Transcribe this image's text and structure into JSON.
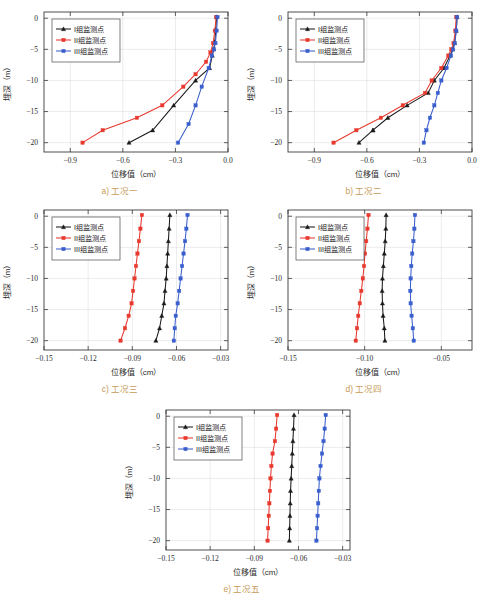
{
  "figure": {
    "axis_titles": {
      "x": "位移值（cm）",
      "y": "埋深（m）"
    },
    "legend": [
      {
        "label": "I组监测点",
        "color": "#1a1a1a",
        "marker": "triangle"
      },
      {
        "label": "II组监测点",
        "color": "#e8392f",
        "marker": "square"
      },
      {
        "label": "III组监测点",
        "color": "#3a5fcd",
        "marker": "square"
      }
    ],
    "colors": {
      "group1": "#1a1a1a",
      "group2": "#e8392f",
      "group3": "#3a5fcd",
      "caption": "#c79a57"
    }
  },
  "chart_data": [
    {
      "id": "a",
      "type": "line",
      "title": "a) 工况一",
      "xlabel": "位移值（cm）",
      "ylabel": "埋深（m）",
      "xlim": [
        -1.05,
        0.0
      ],
      "ylim": [
        -21.5,
        1.0
      ],
      "xticks": [
        -0.9,
        -0.6,
        -0.3,
        0.0
      ],
      "xticklabels": [
        "−0.9",
        "−0.6",
        "−0.3",
        "0.0"
      ],
      "yticks": [
        0,
        -5,
        -10,
        -15,
        -20
      ],
      "yticklabels": [
        "0",
        "−5",
        "−10",
        "−15",
        "−20"
      ],
      "grid": true,
      "legend_position": "upper-left",
      "series": [
        {
          "name": "I组监测点",
          "color": "#1a1a1a",
          "marker": "triangle",
          "x": [
            -0.065,
            -0.07,
            -0.075,
            -0.082,
            -0.09,
            -0.105,
            -0.185,
            -0.31,
            -0.43,
            -0.565
          ],
          "y": [
            0.2,
            -1.8,
            -3.8,
            -5.0,
            -6.0,
            -8.0,
            -10.0,
            -14.0,
            -18.0,
            -20.0
          ]
        },
        {
          "name": "II组监测点",
          "color": "#e8392f",
          "marker": "square",
          "x": [
            -0.068,
            -0.075,
            -0.085,
            -0.1,
            -0.125,
            -0.185,
            -0.255,
            -0.375,
            -0.52,
            -0.715,
            -0.83
          ],
          "y": [
            0.2,
            -2.0,
            -4.0,
            -5.5,
            -7.0,
            -9.0,
            -11.0,
            -14.0,
            -16.0,
            -18.0,
            -20.0
          ]
        },
        {
          "name": "III组监测点",
          "color": "#3a5fcd",
          "marker": "square",
          "x": [
            -0.06,
            -0.065,
            -0.072,
            -0.08,
            -0.092,
            -0.11,
            -0.15,
            -0.185,
            -0.225,
            -0.285
          ],
          "y": [
            0.2,
            -2.0,
            -4.0,
            -5.0,
            -6.0,
            -8.0,
            -11.0,
            -14.0,
            -17.0,
            -20.0
          ]
        }
      ]
    },
    {
      "id": "b",
      "type": "line",
      "title": "b) 工况二",
      "xlabel": "位移值（cm）",
      "ylabel": "埋深（m）",
      "xlim": [
        -1.05,
        0.0
      ],
      "ylim": [
        -21.5,
        1.0
      ],
      "xticks": [
        -0.9,
        -0.6,
        -0.3,
        0.0
      ],
      "xticklabels": [
        "−0.9",
        "−0.6",
        "−0.3",
        "0.0"
      ],
      "yticks": [
        0,
        -5,
        -10,
        -15,
        -20
      ],
      "yticklabels": [
        "0",
        "−5",
        "−10",
        "−15",
        "−20"
      ],
      "grid": true,
      "legend_position": "upper-left",
      "series": [
        {
          "name": "I组监测点",
          "color": "#1a1a1a",
          "marker": "triangle",
          "x": [
            -0.085,
            -0.09,
            -0.1,
            -0.11,
            -0.125,
            -0.16,
            -0.215,
            -0.25,
            -0.37,
            -0.48,
            -0.565
          ],
          "y": [
            0.2,
            -2.0,
            -4.0,
            -5.0,
            -6.0,
            -8.0,
            -10.0,
            -12.0,
            -14.0,
            -16.0,
            -18.0
          ]
        },
        {
          "name": "I组监测点-tail",
          "color": "#1a1a1a",
          "marker": "triangle",
          "x": [
            -0.565,
            -0.645
          ],
          "y": [
            -18.0,
            -20.0
          ]
        },
        {
          "name": "II组监测点",
          "color": "#e8392f",
          "marker": "square",
          "x": [
            -0.09,
            -0.095,
            -0.105,
            -0.118,
            -0.135,
            -0.175,
            -0.23,
            -0.268,
            -0.395,
            -0.52,
            -0.66,
            -0.79
          ],
          "y": [
            0.2,
            -2.0,
            -4.0,
            -5.0,
            -6.0,
            -8.0,
            -10.0,
            -12.0,
            -14.0,
            -16.0,
            -18.0,
            -20.0
          ]
        },
        {
          "name": "III组监测点",
          "color": "#3a5fcd",
          "marker": "square",
          "x": [
            -0.085,
            -0.09,
            -0.098,
            -0.108,
            -0.12,
            -0.145,
            -0.175,
            -0.195,
            -0.215,
            -0.24,
            -0.26,
            -0.275
          ],
          "y": [
            0.2,
            -2.0,
            -4.0,
            -5.0,
            -6.0,
            -8.0,
            -10.0,
            -12.0,
            -14.0,
            -16.0,
            -18.0,
            -20.0
          ]
        }
      ]
    },
    {
      "id": "c",
      "type": "line",
      "title": "c) 工况三",
      "xlabel": "位移值（cm）",
      "ylabel": "埋深（m）",
      "xlim": [
        -0.15,
        -0.025
      ],
      "ylim": [
        -21.5,
        1.0
      ],
      "xticks": [
        -0.15,
        -0.12,
        -0.09,
        -0.06,
        -0.03
      ],
      "xticklabels": [
        "−0.15",
        "−0.12",
        "−0.09",
        "−0.06",
        "−0.03"
      ],
      "yticks": [
        0,
        -5,
        -10,
        -15,
        -20
      ],
      "yticklabels": [
        "0",
        "−5",
        "−10",
        "−15",
        "−20"
      ],
      "grid": true,
      "legend_position": "upper-left",
      "series": [
        {
          "name": "I组监测点",
          "color": "#1a1a1a",
          "marker": "triangle",
          "x": [
            -0.0645,
            -0.065,
            -0.0655,
            -0.066,
            -0.0665,
            -0.067,
            -0.0678,
            -0.0685,
            -0.07,
            -0.0715,
            -0.074
          ],
          "y": [
            0.2,
            -2.0,
            -4.0,
            -6.0,
            -8.0,
            -10.0,
            -12.0,
            -14.0,
            -16.0,
            -18.0,
            -20.0
          ]
        },
        {
          "name": "II组监测点",
          "color": "#e8392f",
          "marker": "square",
          "x": [
            -0.0835,
            -0.0845,
            -0.0855,
            -0.0865,
            -0.0875,
            -0.0885,
            -0.0895,
            -0.0905,
            -0.0925,
            -0.095,
            -0.098
          ],
          "y": [
            0.2,
            -2.0,
            -4.0,
            -6.0,
            -8.0,
            -10.0,
            -12.0,
            -14.0,
            -16.0,
            -18.0,
            -20.0
          ]
        },
        {
          "name": "III组监测点",
          "color": "#3a5fcd",
          "marker": "square",
          "x": [
            -0.0525,
            -0.0533,
            -0.0542,
            -0.0552,
            -0.0562,
            -0.0572,
            -0.0582,
            -0.0592,
            -0.0605,
            -0.0612,
            -0.0618
          ],
          "y": [
            0.2,
            -2.0,
            -4.0,
            -6.0,
            -8.0,
            -10.0,
            -12.0,
            -14.0,
            -16.0,
            -18.0,
            -20.0
          ]
        }
      ]
    },
    {
      "id": "d",
      "type": "line",
      "title": "d) 工况四",
      "xlabel": "位移值（cm）",
      "ylabel": "埋深（m）",
      "xlim": [
        -0.15,
        -0.03
      ],
      "ylim": [
        -21.5,
        1.0
      ],
      "xticks": [
        -0.15,
        -0.1,
        -0.05
      ],
      "xticklabels": [
        "−0.15",
        "−0.10",
        "−0.05"
      ],
      "yticks": [
        0,
        -5,
        -10,
        -15,
        -20
      ],
      "yticklabels": [
        "0",
        "−5",
        "−10",
        "−15",
        "−20"
      ],
      "grid": true,
      "legend_position": "upper-left",
      "series": [
        {
          "name": "I组监测点",
          "color": "#1a1a1a",
          "marker": "triangle",
          "x": [
            -0.086,
            -0.0862,
            -0.0866,
            -0.0872,
            -0.0878,
            -0.0884,
            -0.0886,
            -0.0884,
            -0.088,
            -0.0872,
            -0.0868
          ],
          "y": [
            0.2,
            -2.0,
            -4.0,
            -6.0,
            -8.0,
            -10.0,
            -12.0,
            -14.0,
            -16.0,
            -18.0,
            -20.0
          ]
        },
        {
          "name": "II组监测点",
          "color": "#e8392f",
          "marker": "square",
          "x": [
            -0.0975,
            -0.0982,
            -0.099,
            -0.0998,
            -0.1004,
            -0.1012,
            -0.1022,
            -0.1032,
            -0.1042,
            -0.105,
            -0.1058
          ],
          "y": [
            0.2,
            -2.0,
            -4.0,
            -6.0,
            -8.0,
            -10.0,
            -12.0,
            -14.0,
            -16.0,
            -18.0,
            -20.0
          ]
        },
        {
          "name": "III组监测点",
          "color": "#3a5fcd",
          "marker": "square",
          "x": [
            -0.0672,
            -0.0676,
            -0.0682,
            -0.069,
            -0.0696,
            -0.07,
            -0.0702,
            -0.07,
            -0.0694,
            -0.0686,
            -0.068
          ],
          "y": [
            0.2,
            -2.0,
            -4.0,
            -6.0,
            -8.0,
            -10.0,
            -12.0,
            -14.0,
            -16.0,
            -18.0,
            -20.0
          ]
        }
      ]
    },
    {
      "id": "e",
      "type": "line",
      "title": "e) 工况五",
      "xlabel": "位移值（cm）",
      "ylabel": "埋深（m）",
      "xlim": [
        -0.15,
        -0.025
      ],
      "ylim": [
        -21.5,
        1.0
      ],
      "xticks": [
        -0.15,
        -0.12,
        -0.09,
        -0.06,
        -0.03
      ],
      "xticklabels": [
        "−0.15",
        "−0.12",
        "−0.09",
        "−0.06",
        "−0.03"
      ],
      "yticks": [
        0,
        -5,
        -10,
        -15,
        -20
      ],
      "yticklabels": [
        "0",
        "−5",
        "−10",
        "−15",
        "−20"
      ],
      "grid": true,
      "legend_position": "upper-left",
      "series": [
        {
          "name": "I组监测点",
          "color": "#1a1a1a",
          "marker": "triangle",
          "x": [
            -0.063,
            -0.0634,
            -0.0638,
            -0.0642,
            -0.0646,
            -0.065,
            -0.0654,
            -0.0656,
            -0.0658,
            -0.066,
            -0.0662
          ],
          "y": [
            0.2,
            -2.0,
            -4.0,
            -6.0,
            -8.0,
            -10.0,
            -12.0,
            -14.0,
            -16.0,
            -18.0,
            -20.0
          ]
        },
        {
          "name": "II组监测点",
          "color": "#e8392f",
          "marker": "square",
          "x": [
            -0.0745,
            -0.0752,
            -0.076,
            -0.0776,
            -0.0784,
            -0.079,
            -0.0794,
            -0.0798,
            -0.0802,
            -0.0806,
            -0.081
          ],
          "y": [
            0.2,
            -2.0,
            -4.0,
            -6.0,
            -8.0,
            -10.0,
            -12.0,
            -14.0,
            -16.0,
            -18.0,
            -20.0
          ]
        },
        {
          "name": "III组监测点",
          "color": "#3a5fcd",
          "marker": "square",
          "x": [
            -0.0415,
            -0.0422,
            -0.043,
            -0.044,
            -0.045,
            -0.0458,
            -0.0462,
            -0.0466,
            -0.047,
            -0.0474,
            -0.0478
          ],
          "y": [
            0.2,
            -2.0,
            -4.0,
            -6.0,
            -8.0,
            -10.0,
            -12.0,
            -14.0,
            -16.0,
            -18.0,
            -20.0
          ]
        }
      ]
    }
  ]
}
